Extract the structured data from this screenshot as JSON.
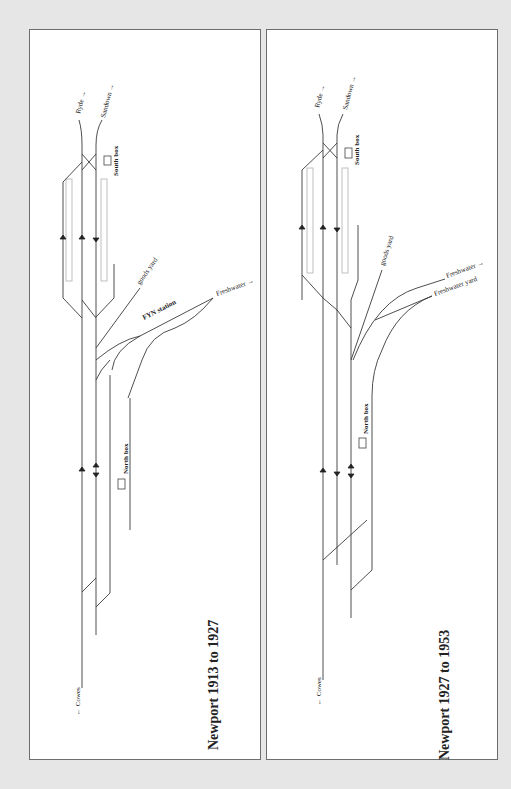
{
  "page": {
    "background": "#e6e6e6",
    "panel_background": "#ffffff",
    "border_color": "#6e6e6e",
    "track_color": "#3a3a3a",
    "platform_color": "#b9b9b9"
  },
  "panels": [
    {
      "title": "Newport 1913 to 1927",
      "labels": {
        "ryde": "Ryde →",
        "sandown": "Sandown →",
        "south_box": "South box",
        "goods_yard": "goods yard",
        "fyn_station": "FYN station",
        "freshwater": "Freshwater →",
        "north_box": "North box",
        "cowes": "← Cowes"
      },
      "direction_arrows": [
        "up",
        "up",
        "down",
        "up",
        "up-down"
      ]
    },
    {
      "title": "Newport 1927 to 1953",
      "labels": {
        "ryde": "Ryde →",
        "sandown": "Sandown →",
        "south_box": "South box",
        "goods_yard": "goods yard",
        "freshwater": "Freshwater →",
        "freshwater_yard": "Freshwater yard",
        "north_box": "North box",
        "cowes": "← Cowes"
      },
      "direction_arrows": [
        "up",
        "up",
        "down",
        "up",
        "down",
        "up-down"
      ]
    }
  ]
}
